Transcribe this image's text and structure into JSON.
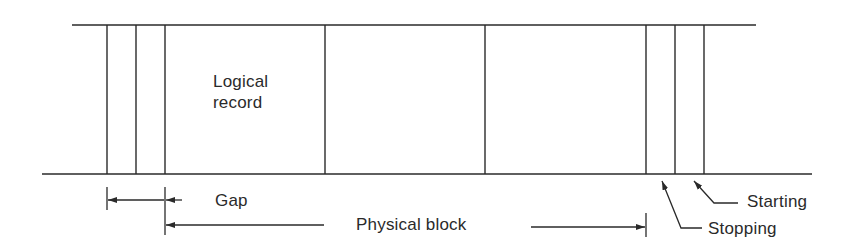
{
  "diagram": {
    "colors": {
      "line": "#2a2a2a",
      "background": "#ffffff"
    },
    "tape": {
      "top_edge": {
        "x1": 72,
        "x2": 756,
        "y": 25
      },
      "bottom_edge": {
        "x1": 42,
        "x2": 812,
        "y": 174
      },
      "dividers_x": [
        107,
        136,
        165,
        325,
        485,
        646,
        675,
        704
      ]
    },
    "labels": {
      "logical_record": "Logical\nrecord",
      "gap": "Gap",
      "physical_block": "Physical block",
      "starting": "Starting",
      "stopping": "Stopping"
    },
    "annotations": {
      "gap": {
        "from_x": 107,
        "to_x": 165,
        "y": 200
      },
      "physical_block": {
        "from_x": 165,
        "to_x": 646,
        "y": 226
      }
    }
  }
}
